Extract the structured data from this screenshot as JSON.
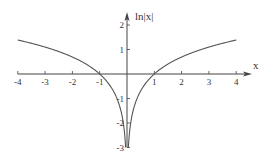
{
  "chart_data": {
    "type": "line",
    "title": "",
    "function": "ln|x|",
    "xlabel": "x",
    "ylabel": "ln|x|",
    "xlim": [
      -4,
      4
    ],
    "ylim": [
      -3,
      2.5
    ],
    "x_ticks": [
      -4,
      -3,
      -2,
      -1,
      1,
      2,
      3,
      4
    ],
    "y_ticks": [
      -3,
      -2,
      -1,
      1,
      2
    ],
    "grid": false,
    "legend": null,
    "series": [
      {
        "name": "ln|x| (x<0)",
        "x": [
          -4,
          -3,
          -2,
          -1,
          -0.5,
          -0.2,
          -0.1,
          -0.05
        ],
        "y": [
          1.386,
          1.099,
          0.693,
          0,
          -0.693,
          -1.609,
          -2.303,
          -3.0
        ]
      },
      {
        "name": "ln|x| (x>0)",
        "x": [
          0.05,
          0.1,
          0.2,
          0.5,
          1,
          2,
          3,
          4
        ],
        "y": [
          -3.0,
          -2.303,
          -1.609,
          -0.693,
          0,
          0.693,
          1.099,
          1.386
        ]
      }
    ],
    "colors": {
      "axis": "#444444",
      "curve": "#555555"
    }
  }
}
